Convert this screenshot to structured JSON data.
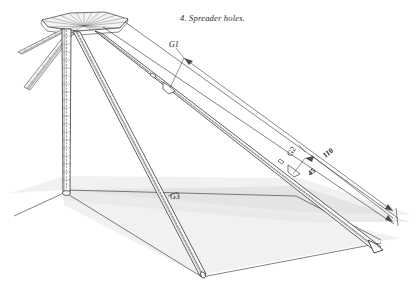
{
  "figure": {
    "caption": "4. Spreader holes.",
    "background_color": "#ffffff",
    "ink_color": "#1a1a1a",
    "ground_shade_color": "#d9d9d9"
  },
  "labels": {
    "g1": "G1",
    "g2": "G2",
    "g3": "G3"
  },
  "dimensions": {
    "upper": "110",
    "lower": "45"
  }
}
